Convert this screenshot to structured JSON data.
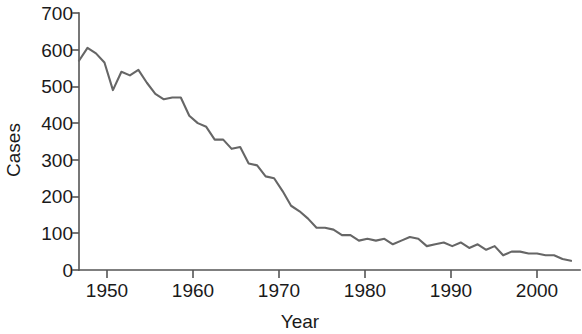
{
  "chart_data": {
    "type": "line",
    "title": "",
    "subtitle": "",
    "xlabel": "Year",
    "ylabel": "Cases",
    "xlim": [
      1947,
      2005
    ],
    "ylim": [
      0,
      700
    ],
    "grid": false,
    "legend": null,
    "x_ticks": [
      1950,
      1960,
      1970,
      1980,
      1990,
      2000
    ],
    "y_ticks": [
      0,
      100,
      200,
      300,
      400,
      500,
      600,
      700
    ],
    "line_color": "#666666",
    "series": [
      {
        "name": "Cases",
        "x": [
          1947,
          1948,
          1949,
          1950,
          1951,
          1952,
          1953,
          1954,
          1955,
          1956,
          1957,
          1958,
          1959,
          1960,
          1961,
          1962,
          1963,
          1964,
          1965,
          1966,
          1967,
          1968,
          1969,
          1970,
          1971,
          1972,
          1973,
          1974,
          1975,
          1976,
          1977,
          1978,
          1979,
          1980,
          1981,
          1982,
          1983,
          1984,
          1985,
          1986,
          1987,
          1988,
          1989,
          1990,
          1991,
          1992,
          1993,
          1994,
          1995,
          1996,
          1997,
          1998,
          1999,
          2000,
          2001,
          2002,
          2003,
          2004,
          2005
        ],
        "values": [
          570,
          605,
          590,
          565,
          490,
          540,
          530,
          545,
          510,
          480,
          465,
          470,
          470,
          420,
          400,
          390,
          355,
          355,
          330,
          335,
          290,
          285,
          255,
          250,
          215,
          175,
          160,
          140,
          115,
          115,
          110,
          95,
          95,
          80,
          85,
          80,
          85,
          70,
          80,
          90,
          85,
          65,
          70,
          75,
          65,
          75,
          60,
          70,
          55,
          65,
          40,
          50,
          50,
          45,
          45,
          40,
          40,
          30,
          25
        ]
      }
    ]
  },
  "axis": {
    "x_tick_labels": [
      "1950",
      "1960",
      "1970",
      "1980",
      "1990",
      "2000"
    ],
    "y_tick_labels": [
      "0",
      "100",
      "200",
      "300",
      "400",
      "500",
      "600",
      "700"
    ],
    "x_axis_title": "Year",
    "y_axis_title": "Cases"
  }
}
